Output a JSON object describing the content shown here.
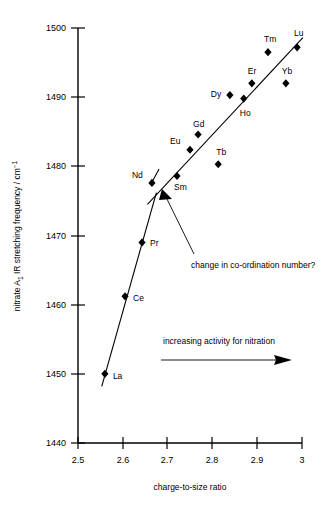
{
  "chart_data": {
    "type": "scatter",
    "title": "",
    "xlabel": "charge-to-size ratio",
    "ylabel": "nitrate A₁ IR stretching frequency / cm⁻¹",
    "xlim": [
      2.5,
      3.0
    ],
    "ylim": [
      1440,
      1500
    ],
    "xticks": [
      "2.5",
      "2.6",
      "2.7",
      "2.8",
      "2.9",
      "3"
    ],
    "xtick_values": [
      2.5,
      2.6,
      2.7,
      2.8,
      2.9,
      3.0
    ],
    "yticks": [
      "1440",
      "1450",
      "1460",
      "1470",
      "1480",
      "1490",
      "1500"
    ],
    "ytick_values": [
      1440,
      1450,
      1460,
      1470,
      1480,
      1490,
      1500
    ],
    "grid": false,
    "legend": "none",
    "points": [
      {
        "label": "La",
        "x": 2.56,
        "y": 1450.0,
        "label_dx": 8,
        "label_dy": 5
      },
      {
        "label": "Ce",
        "x": 2.605,
        "y": 1461.2,
        "label_dx": 8,
        "label_dy": 5
      },
      {
        "label": "Pr",
        "x": 2.643,
        "y": 1469.0,
        "label_dx": 8,
        "label_dy": 4
      },
      {
        "label": "Nd",
        "x": 2.665,
        "y": 1477.6,
        "label_dx": -20,
        "label_dy": -5
      },
      {
        "label": "Sm",
        "x": 2.721,
        "y": 1478.6,
        "label_dx": -3,
        "label_dy": 14
      },
      {
        "label": "Eu",
        "x": 2.75,
        "y": 1482.4,
        "label_dx": -20,
        "label_dy": -6
      },
      {
        "label": "Gd",
        "x": 2.768,
        "y": 1484.6,
        "label_dx": -5,
        "label_dy": -8
      },
      {
        "label": "Tb",
        "x": 2.813,
        "y": 1480.3,
        "label_dx": -2,
        "label_dy": -9
      },
      {
        "label": "Dy",
        "x": 2.839,
        "y": 1490.3,
        "label_dx": -19,
        "label_dy": 2
      },
      {
        "label": "Ho",
        "x": 2.87,
        "y": 1489.8,
        "label_dx": -4,
        "label_dy": 17
      },
      {
        "label": "Er",
        "x": 2.888,
        "y": 1492.0,
        "label_dx": -4,
        "label_dy": -9
      },
      {
        "label": "Tm",
        "x": 2.924,
        "y": 1496.5,
        "label_dx": -4,
        "label_dy": -10
      },
      {
        "label": "Yb",
        "x": 2.964,
        "y": 1492.0,
        "label_dx": -4,
        "label_dy": -9
      },
      {
        "label": "Lu",
        "x": 2.989,
        "y": 1497.2,
        "label_dx": -3,
        "label_dy": -11
      }
    ],
    "trend_lines": [
      {
        "name": "lower-steep-line",
        "x1": 2.553,
        "y1": 1448.2,
        "x2": 2.675,
        "y2": 1476.2
      },
      {
        "name": "upper-trend-line",
        "x1": 2.655,
        "y1": 1474.5,
        "x2": 3.002,
        "y2": 1498.6
      }
    ],
    "break_mark": {
      "x": 2.672,
      "y": 1478.6
    },
    "annotations": [
      {
        "name": "coordination-note",
        "text": "change in co-ordination number?",
        "x": 2.88,
        "y": 1466.2
      },
      {
        "name": "activity-note",
        "text": "increasing activity for nitration",
        "x": 2.855,
        "y": 1455.0
      }
    ]
  },
  "axes": {
    "x_title": "charge-to-size ratio",
    "y_title": "nitrate A₁ IR stretching frequency / cm⁻¹",
    "y_title_main": "nitrate A",
    "y_title_sub": "1",
    "y_title_rest": " IR stretching frequency / cm",
    "y_title_sup": "−1"
  }
}
